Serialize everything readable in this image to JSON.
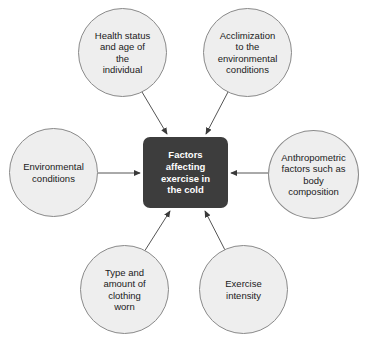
{
  "diagram": {
    "type": "hub-and-spoke concept map",
    "center": {
      "label": "Factors\naffecting\nexercise in\nthe cold",
      "fill_color": "#3d3d3d",
      "text_color": "#ffffff"
    },
    "node_fill_color": "#eeeeee",
    "node_stroke_color": "#8a8a8a",
    "connector_color": "#555555",
    "nodes": [
      {
        "id": "health",
        "label": "Health status\nand age of\nthe\nindividual",
        "position": "top-left",
        "arrow_direction": "into-center"
      },
      {
        "id": "acclimization",
        "label": "Acclimization\nto the\nenvironmental\nconditions",
        "position": "top-right",
        "arrow_direction": "into-center"
      },
      {
        "id": "environmental",
        "label": "Environmental\nconditions",
        "position": "left",
        "arrow_direction": "into-center"
      },
      {
        "id": "anthropometric",
        "label": "Anthropometric\nfactors such as\nbody\ncomposition",
        "position": "right",
        "arrow_direction": "into-center"
      },
      {
        "id": "clothing",
        "label": "Type and\namount of\nclothing\nworn",
        "position": "bottom-left",
        "arrow_direction": "into-center"
      },
      {
        "id": "intensity",
        "label": "Exercise\nintensity",
        "position": "bottom-right",
        "arrow_direction": "into-center"
      }
    ]
  }
}
